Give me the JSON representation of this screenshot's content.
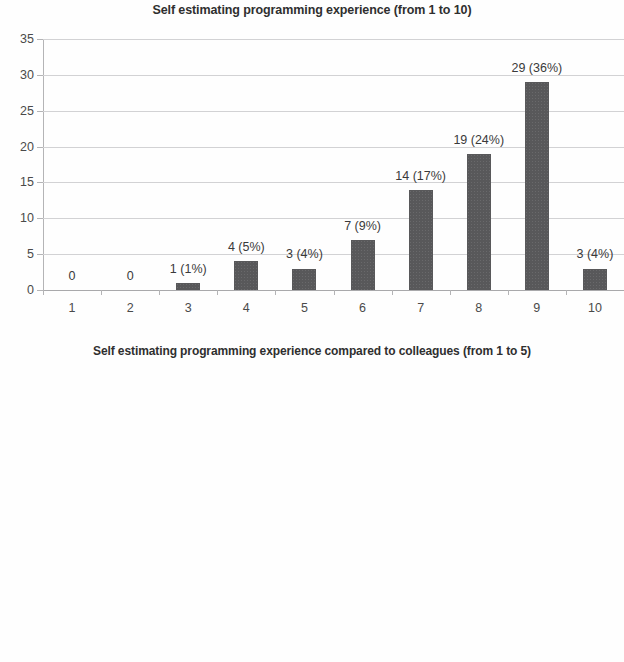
{
  "page": {
    "background_color": "#fefefe",
    "bar_color": "#58585a",
    "gridline_color": "#d2d2d4",
    "axis_color": "#b4b4b6",
    "text_color": "#3d3d3d"
  },
  "charts": [
    {
      "id": "programming-experience-1-to-10",
      "title": "Self estimating programming experience (from 1 to 10)",
      "xlabel": "",
      "ylabel": "",
      "categories": [
        "1",
        "2",
        "3",
        "4",
        "5",
        "6",
        "7",
        "8",
        "9",
        "10"
      ],
      "values": [
        0,
        0,
        1,
        4,
        3,
        7,
        14,
        19,
        29,
        3
      ],
      "point_labels": [
        "0",
        "0",
        "1 (1%)",
        "4 (5%)",
        "3 (4%)",
        "7 (9%)",
        "14 (17%)",
        "19 (24%)",
        "29 (36%)",
        "3 (4%)"
      ],
      "yticks": [
        "0",
        "5",
        "10",
        "15",
        "20",
        "25",
        "30",
        "35"
      ],
      "ytick_values": [
        0,
        5,
        10,
        15,
        20,
        25,
        30,
        35
      ],
      "ylim": [
        0,
        35
      ]
    },
    {
      "id": "programming-experience-vs-colleagues-1-to-5",
      "title": "Self estimating programming experience compared to colleagues (from 1 to 5)",
      "xlabel": "",
      "ylabel": "",
      "categories": [
        "1",
        "2",
        "3",
        "4",
        "5"
      ],
      "values": [
        0,
        5,
        23,
        43,
        9
      ],
      "point_labels": [
        "0",
        "5 (6%)",
        "23 (29%)",
        "43 (54%)",
        "9 (11%)"
      ],
      "yticks": [
        "0",
        "5",
        "10",
        "15",
        "20",
        "25",
        "30",
        "35",
        "40",
        "45",
        "50"
      ],
      "ytick_values": [
        0,
        5,
        10,
        15,
        20,
        25,
        30,
        35,
        40,
        45,
        50
      ],
      "ylim": [
        0,
        50
      ]
    }
  ],
  "chart_data": [
    {
      "type": "bar",
      "title": "Self estimating programming experience (from 1 to 10)",
      "categories": [
        "1",
        "2",
        "3",
        "4",
        "5",
        "6",
        "7",
        "8",
        "9",
        "10"
      ],
      "values": [
        0,
        0,
        1,
        4,
        3,
        7,
        14,
        19,
        29,
        3
      ],
      "data_labels": [
        "0",
        "0",
        "1 (1%)",
        "4 (5%)",
        "3 (4%)",
        "7 (9%)",
        "14 (17%)",
        "19 (24%)",
        "29 (36%)",
        "3 (4%)"
      ],
      "percentages": [
        0,
        0,
        1,
        5,
        4,
        9,
        17,
        24,
        36,
        4
      ],
      "xlabel": "",
      "ylabel": "",
      "ylim": [
        0,
        35
      ],
      "ytick_step": 5,
      "grid": true,
      "legend": "none",
      "series_color": "#58585a"
    },
    {
      "type": "bar",
      "title": "Self estimating programming experience compared to colleagues (from 1 to 5)",
      "categories": [
        "1",
        "2",
        "3",
        "4",
        "5"
      ],
      "values": [
        0,
        5,
        23,
        43,
        9
      ],
      "data_labels": [
        "0",
        "5 (6%)",
        "23 (29%)",
        "43 (54%)",
        "9 (11%)"
      ],
      "percentages": [
        0,
        6,
        29,
        54,
        11
      ],
      "xlabel": "",
      "ylabel": "",
      "ylim": [
        0,
        50
      ],
      "ytick_step": 5,
      "grid": true,
      "legend": "none",
      "series_color": "#58585a"
    }
  ]
}
